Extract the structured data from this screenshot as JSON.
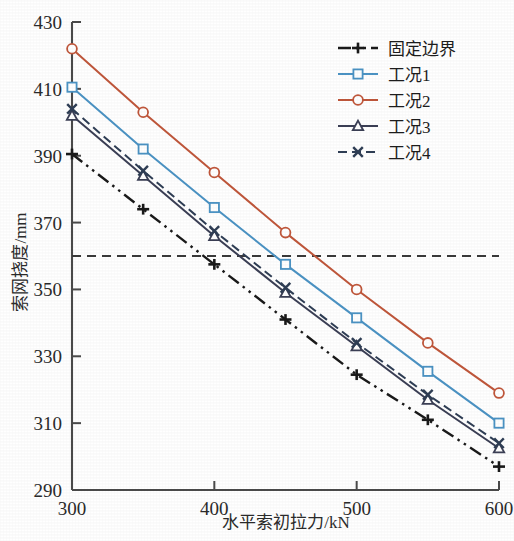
{
  "figure": {
    "background_color": "#ffffff",
    "plot_area": {
      "left": 72,
      "top": 22,
      "right": 499,
      "bottom": 490
    }
  },
  "chart_data": {
    "type": "line",
    "title": "",
    "subtitle": "",
    "xlabel": "水平索初拉力/kN",
    "ylabel": "索网挠度/mm",
    "x": [
      300,
      350,
      400,
      450,
      500,
      550,
      600
    ],
    "xlim": [
      300,
      600
    ],
    "ylim": [
      290,
      430
    ],
    "xticks": [
      300,
      400,
      500,
      600
    ],
    "xtick_labels": [
      "300",
      "400",
      "500",
      "600"
    ],
    "x_minor_ticks": [
      350,
      450,
      550
    ],
    "yticks": [
      290,
      310,
      330,
      350,
      370,
      390,
      410,
      430
    ],
    "ytick_labels": [
      "290",
      "310",
      "330",
      "350",
      "370",
      "390",
      "410",
      "430"
    ],
    "grid": false,
    "legend_position": "top-right",
    "annotations": [
      {
        "name": "deflection-limit-line",
        "type": "hline",
        "value": 360,
        "style": "dashed",
        "color": "#3a3a3a"
      }
    ],
    "series": [
      {
        "name": "固定边界",
        "color": "#1a1a1a",
        "marker": "plus",
        "linestyle": "dashdotdot",
        "values": [
          390.5,
          374.0,
          357.5,
          341.0,
          324.5,
          311.0,
          297.0
        ]
      },
      {
        "name": "工况1",
        "color": "#4b93c4",
        "marker": "square",
        "linestyle": "solid",
        "values": [
          410.5,
          392.0,
          374.5,
          357.5,
          341.5,
          325.5,
          310.0
        ]
      },
      {
        "name": "工况2",
        "color": "#c0573b",
        "marker": "circle",
        "linestyle": "solid",
        "values": [
          422.0,
          403.0,
          385.0,
          367.0,
          350.0,
          334.0,
          319.0
        ]
      },
      {
        "name": "工况3",
        "color": "#3b3f55",
        "marker": "triangle",
        "linestyle": "solid",
        "values": [
          402.0,
          384.0,
          366.0,
          349.0,
          333.0,
          317.0,
          302.5
        ]
      },
      {
        "name": "工况4",
        "color": "#2f3e55",
        "marker": "cross",
        "linestyle": "dashed",
        "values": [
          404.0,
          385.5,
          367.5,
          350.5,
          334.0,
          318.5,
          304.0
        ]
      }
    ]
  },
  "legend": {
    "entries": [
      {
        "label": "固定边界"
      },
      {
        "label": "工况1"
      },
      {
        "label": "工况2"
      },
      {
        "label": "工况3"
      },
      {
        "label": "工况4"
      }
    ]
  }
}
